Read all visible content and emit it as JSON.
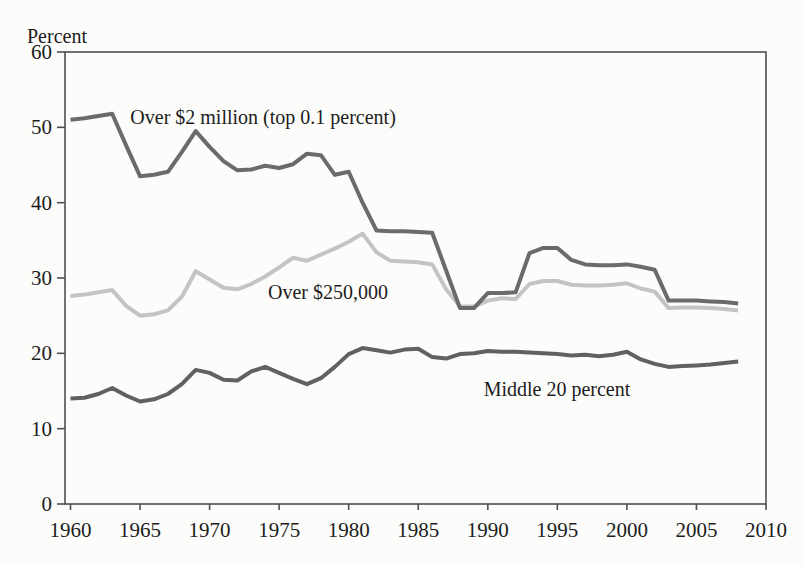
{
  "figure": {
    "background": "#fcfcfb",
    "axis_color": "#4f4f4f",
    "text_color": "#1c1c1c"
  },
  "chart_data": {
    "type": "line",
    "title": "",
    "xlabel": "",
    "ylabel": "Percent",
    "xlim": [
      1960,
      2010
    ],
    "ylim": [
      0,
      60
    ],
    "x_ticks": [
      1960,
      1965,
      1970,
      1975,
      1980,
      1985,
      1990,
      1995,
      2000,
      2005,
      2010
    ],
    "y_ticks": [
      0,
      10,
      20,
      30,
      40,
      50,
      60
    ],
    "grid": false,
    "legend_position": "inline-annotations",
    "x": [
      1960,
      1961,
      1962,
      1963,
      1964,
      1965,
      1966,
      1967,
      1968,
      1969,
      1970,
      1971,
      1972,
      1973,
      1974,
      1975,
      1976,
      1977,
      1978,
      1979,
      1980,
      1981,
      1982,
      1983,
      1984,
      1985,
      1986,
      1987,
      1988,
      1989,
      1990,
      1991,
      1992,
      1993,
      1994,
      1995,
      1996,
      1997,
      1998,
      1999,
      2000,
      2001,
      2002,
      2003,
      2004,
      2005,
      2006,
      2007,
      2008
    ],
    "series": [
      {
        "name": "Over $2 million (top 0.1 percent)",
        "color": "#6b6b6b",
        "stroke_width": 4,
        "values": [
          51.0,
          51.2,
          51.5,
          51.8,
          47.6,
          43.5,
          43.7,
          44.1,
          46.7,
          49.5,
          47.4,
          45.5,
          44.3,
          44.4,
          44.9,
          44.6,
          45.1,
          46.5,
          46.3,
          43.7,
          44.1,
          40.0,
          36.3,
          36.2,
          36.2,
          36.1,
          36.0,
          31.0,
          26.0,
          26.0,
          28.0,
          28.0,
          28.1,
          33.3,
          34.0,
          34.0,
          32.4,
          31.8,
          31.7,
          31.7,
          31.8,
          31.5,
          31.1,
          27.0,
          27.0,
          27.0,
          26.9,
          26.8,
          26.6
        ]
      },
      {
        "name": "Over $250,000",
        "color": "#c4c4c4",
        "stroke_width": 4,
        "values": [
          27.6,
          27.8,
          28.1,
          28.4,
          26.3,
          25.0,
          25.2,
          25.7,
          27.5,
          30.9,
          29.8,
          28.7,
          28.5,
          29.2,
          30.2,
          31.4,
          32.7,
          32.3,
          33.1,
          33.9,
          34.8,
          35.9,
          33.4,
          32.3,
          32.2,
          32.1,
          31.8,
          28.5,
          26.2,
          26.2,
          27.0,
          27.3,
          27.2,
          29.2,
          29.6,
          29.6,
          29.1,
          29.0,
          29.0,
          29.1,
          29.3,
          28.6,
          28.2,
          26.0,
          26.1,
          26.1,
          26.0,
          25.9,
          25.7
        ]
      },
      {
        "name": "Middle 20 percent",
        "color": "#616161",
        "stroke_width": 4,
        "values": [
          14.0,
          14.1,
          14.6,
          15.4,
          14.4,
          13.6,
          13.9,
          14.6,
          15.9,
          17.8,
          17.4,
          16.5,
          16.4,
          17.6,
          18.2,
          17.4,
          16.6,
          15.9,
          16.7,
          18.2,
          19.9,
          20.7,
          20.4,
          20.1,
          20.5,
          20.6,
          19.5,
          19.3,
          19.9,
          20.0,
          20.3,
          20.2,
          20.2,
          20.1,
          20.0,
          19.9,
          19.7,
          19.8,
          19.6,
          19.8,
          20.2,
          19.2,
          18.6,
          18.2,
          18.3,
          18.4,
          18.5,
          18.7,
          18.9
        ]
      }
    ],
    "draw_order": [
      1,
      0,
      2
    ],
    "annotations": [
      {
        "text": "Over $2 million (top 0.1 percent)",
        "x": 1964.3,
        "y": 51.4
      },
      {
        "text": "Over $250,000",
        "x": 1974.2,
        "y": 28.2
      },
      {
        "text": "Middle 20 percent",
        "x": 1989.7,
        "y": 15.2
      }
    ]
  }
}
